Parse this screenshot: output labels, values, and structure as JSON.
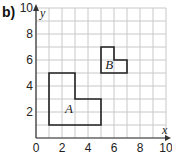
{
  "part_label": "b)",
  "axes": {
    "x_label": "x",
    "y_label": "y",
    "x_ticks": [
      "0",
      "2",
      "4",
      "6",
      "8",
      "10"
    ],
    "y_ticks": [
      "2",
      "4",
      "6",
      "8",
      "10"
    ],
    "range": [
      0,
      10
    ]
  },
  "shapes": [
    {
      "label": "A",
      "vertices": [
        [
          1,
          1
        ],
        [
          5,
          1
        ],
        [
          5,
          3
        ],
        [
          3,
          3
        ],
        [
          3,
          5
        ],
        [
          1,
          5
        ]
      ]
    },
    {
      "label": "B",
      "vertices": [
        [
          5,
          5
        ],
        [
          7,
          5
        ],
        [
          7,
          6
        ],
        [
          6,
          6
        ],
        [
          6,
          7
        ],
        [
          5,
          7
        ]
      ]
    }
  ],
  "colors": {
    "grid": "#c8c8c8",
    "axis": "#333333",
    "shape": "#222222"
  }
}
